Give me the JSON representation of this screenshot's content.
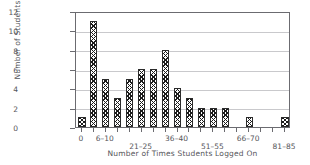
{
  "chart_data": {
    "type": "bar",
    "title": "",
    "xlabel": "Number of Times Students Logged On",
    "ylabel": "Number of Students",
    "categories": [
      "0",
      "1–5",
      "6–10",
      "11–15",
      "16–20",
      "21–25",
      "26–30",
      "31–35",
      "36–40",
      "41–45",
      "46–50",
      "51–55",
      "56–60",
      "61–65",
      "66–70",
      "71–75",
      "76–80",
      "81–85"
    ],
    "values": [
      1,
      11,
      5,
      3,
      5,
      6,
      6,
      8,
      4,
      3,
      2,
      2,
      2,
      0,
      1,
      0,
      0,
      1
    ],
    "ylim": [
      0,
      12
    ],
    "yticks": [
      0,
      2,
      4,
      6,
      8,
      10,
      12
    ],
    "ytick_labels": [
      "0",
      "2",
      "4",
      "6",
      "8",
      "10",
      "12"
    ],
    "visible_xtick_labels": [
      {
        "index": 0,
        "label": "0",
        "row": 0
      },
      {
        "index": 2,
        "label": "6–10",
        "row": 0
      },
      {
        "index": 5,
        "label": "21–25",
        "row": 1
      },
      {
        "index": 8,
        "label": "36–40",
        "row": 0
      },
      {
        "index": 11,
        "label": "51–55",
        "row": 1
      },
      {
        "index": 14,
        "label": "66–70",
        "row": 0
      },
      {
        "index": 17,
        "label": "81–85",
        "row": 1
      }
    ],
    "grid": true,
    "grid_axis": "y",
    "legend": null,
    "bar_fill": "cross-hatch",
    "colors": {
      "bar_edge": "#2b2b2b",
      "bar_face": "#ffffff",
      "axis": "#6b6b70",
      "grid": "#c9c9cc",
      "text": "#55555a",
      "background": "#ffffff"
    }
  }
}
